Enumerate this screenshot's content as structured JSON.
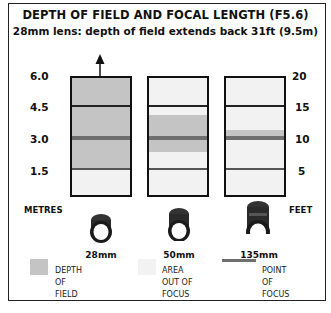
{
  "title": "DEPTH OF FIELD AND FOCAL LENGTH (F5.6)",
  "subtitle": "28mm lens: depth of field extends back 31ft (9.5m)",
  "axes": {
    "left_unit": "METRES",
    "right_unit": "FEET",
    "left_ticks": [
      "6.0",
      "4.5",
      "3.0",
      "1.5"
    ],
    "right_ticks": [
      "20",
      "15",
      "10",
      "5"
    ]
  },
  "lenses": [
    {
      "label": "28mm",
      "dof_near_m": 1.6,
      "dof_far_m": "beyond 6.0 (arrow)",
      "focus_m": 3.0
    },
    {
      "label": "50mm",
      "dof_near_m": 2.4,
      "dof_far_m": 3.9,
      "focus_m": 3.0
    },
    {
      "label": "135mm",
      "dof_near_m": 2.9,
      "dof_far_m": 3.3,
      "focus_m": 3.0
    }
  ],
  "legend": {
    "dof": {
      "line1": "DEPTH",
      "line2": "OF",
      "line3": "FIELD",
      "color": "#c4c4c4"
    },
    "out_of_focus": {
      "line1": "AREA",
      "line2": "OUT OF",
      "line3": "FOCUS",
      "color": "#f2f2f2"
    },
    "focus_point": {
      "line1": "POINT",
      "line2": "OF",
      "line3": "FOCUS",
      "color": "#6e6e6e"
    }
  }
}
